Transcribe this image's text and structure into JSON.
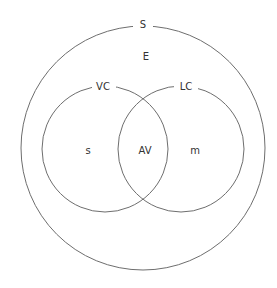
{
  "diagram": {
    "type": "venn",
    "colors": {
      "stroke": "#6e6e6e",
      "text": "#333333",
      "background": "#ffffff"
    },
    "outer_set": {
      "label": "S",
      "region_label": "E",
      "cx": 143,
      "cy": 148,
      "r": 122
    },
    "sets": [
      {
        "label": "VC",
        "region_label": "s",
        "cx": 105,
        "cy": 149,
        "r": 63
      },
      {
        "label": "LC",
        "region_label": "m",
        "cx": 181,
        "cy": 149,
        "r": 63
      }
    ],
    "intersection_label": "AV"
  }
}
